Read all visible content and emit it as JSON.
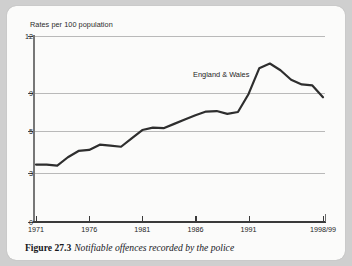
{
  "figure": {
    "caption_label": "Figure 27.3",
    "caption_text": "Notifiable offences recorded by the police"
  },
  "chart_data": {
    "type": "line",
    "title": "",
    "ylabel": "Rates per 100 population",
    "xlabel": "",
    "annotation": "England & Wales",
    "grid": true,
    "legend_position": "inline-annotation",
    "ylim": [
      0,
      12
    ],
    "ytick_labels": [
      "0",
      "3",
      "5",
      "9",
      "12"
    ],
    "ytick_values": [
      0,
      3,
      5,
      9,
      12
    ],
    "xtick_labels": [
      "1971",
      "1976",
      "1981",
      "1986",
      "1991",
      "1998/99"
    ],
    "xtick_values": [
      1971,
      1976,
      1981,
      1986,
      1991,
      1998
    ],
    "xlim": [
      1971,
      1998
    ],
    "series": [
      {
        "name": "England & Wales",
        "color": "#2e2e2e",
        "x": [
          1971,
          1972,
          1973,
          1974,
          1975,
          1976,
          1977,
          1978,
          1979,
          1980,
          1981,
          1982,
          1983,
          1984,
          1985,
          1986,
          1987,
          1988,
          1989,
          1990,
          1991,
          1992,
          1993,
          1994,
          1995,
          1996,
          1997,
          1998
        ],
        "values": [
          3.4,
          3.4,
          3.35,
          3.75,
          4.05,
          4.1,
          4.35,
          4.3,
          4.25,
          4.65,
          5.1,
          5.35,
          5.3,
          5.75,
          6.2,
          6.65,
          7.05,
          7.1,
          6.8,
          7.0,
          8.9,
          10.3,
          10.55,
          10.2,
          9.7,
          9.45,
          9.4,
          8.55
        ]
      }
    ]
  }
}
